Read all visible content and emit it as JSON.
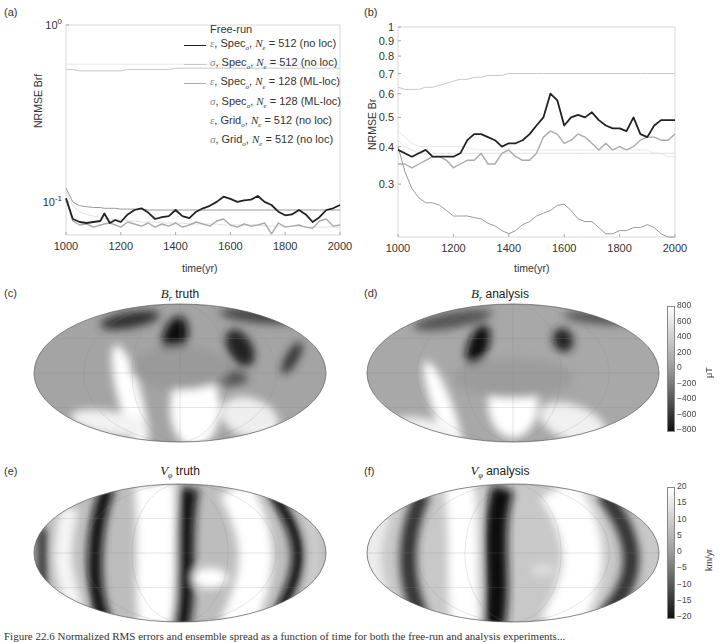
{
  "panels": {
    "a": {
      "label": "(a)"
    },
    "b": {
      "label": "(b)"
    },
    "c": {
      "label": "(c)",
      "title_var": "B",
      "title_sub": "r",
      "title_rest": " truth"
    },
    "d": {
      "label": "(d)",
      "title_var": "B",
      "title_sub": "r",
      "title_rest": " analysis"
    },
    "e": {
      "label": "(e)",
      "title_var": "V",
      "title_sub": "φ",
      "title_rest": " truth"
    },
    "f": {
      "label": "(f)",
      "title_var": "V",
      "title_sub": "φ",
      "title_rest": " analysis"
    }
  },
  "legend": {
    "title": "Free-run",
    "entries": [
      {
        "sym": "ε",
        "grid": "Spec",
        "n": "512",
        "loc": "(no loc)",
        "color": "#222222",
        "width": 1.8
      },
      {
        "sym": "σ",
        "grid": "Spec",
        "n": "512",
        "loc": "(no loc)",
        "color": "#c8c8c8",
        "width": 1
      },
      {
        "sym": "ε",
        "grid": "Spec",
        "n": "128",
        "loc": "(ML-loc)",
        "color": "#aaaaaa",
        "width": 1.4
      },
      {
        "sym": "σ",
        "grid": "Spec",
        "n": "128",
        "loc": "(ML-loc)",
        "color": "#e0e0e0",
        "width": 1
      },
      {
        "sym": "ε",
        "grid": "Grid",
        "n": "512",
        "loc": "(no loc)",
        "color": "#9a9a9a",
        "width": 1
      },
      {
        "sym": "σ",
        "grid": "Grid",
        "n": "512",
        "loc": "(no loc)",
        "color": "#e8e8e8",
        "width": 1
      }
    ]
  },
  "colorbars": {
    "br": {
      "ticks": [
        "800",
        "600",
        "400",
        "200",
        "0",
        "−200",
        "−400",
        "−600",
        "−800"
      ],
      "unit": "μT"
    },
    "vphi": {
      "ticks": [
        "20",
        "15",
        "10",
        "5",
        "0",
        "−5",
        "−10",
        "−15",
        "−20"
      ],
      "unit": "km/yr"
    }
  },
  "caption": "Figure 22.6  Normalized RMS errors and ensemble spread as a function of time for both the free-run and analysis experiments...",
  "chart_data": [
    {
      "type": "line",
      "panel": "a",
      "title": "",
      "xlabel": "time(yr)",
      "ylabel": "NRMSE Brf",
      "yscale": "log",
      "xlim": [
        1000,
        2000
      ],
      "ylim": [
        0.065,
        1.0
      ],
      "xticks": [
        "1000",
        "1200",
        "1400",
        "1600",
        "1800",
        "2000"
      ],
      "yticks": [
        {
          "v": 1.0,
          "label": "10^0"
        },
        {
          "v": 0.1,
          "label": "10^-1"
        }
      ],
      "legend_position": "upper right",
      "x": [
        1000,
        1025,
        1050,
        1075,
        1100,
        1125,
        1140,
        1160,
        1180,
        1200,
        1225,
        1250,
        1275,
        1300,
        1325,
        1350,
        1375,
        1400,
        1425,
        1450,
        1475,
        1500,
        1525,
        1550,
        1575,
        1600,
        1625,
        1650,
        1675,
        1700,
        1725,
        1750,
        1775,
        1800,
        1825,
        1850,
        1875,
        1900,
        1925,
        1950,
        1975,
        2000
      ],
      "series": [
        {
          "name": "ε, Spec_o, N_e = 512 (no loc)",
          "values": [
            0.105,
            0.08,
            0.077,
            0.076,
            0.077,
            0.078,
            0.086,
            0.076,
            0.079,
            0.077,
            0.085,
            0.09,
            0.092,
            0.087,
            0.08,
            0.082,
            0.083,
            0.09,
            0.083,
            0.081,
            0.088,
            0.092,
            0.095,
            0.1,
            0.107,
            0.104,
            0.1,
            0.102,
            0.103,
            0.108,
            0.1,
            0.096,
            0.088,
            0.084,
            0.085,
            0.09,
            0.085,
            0.077,
            0.082,
            0.09,
            0.092,
            0.096
          ]
        },
        {
          "name": "σ, Spec_o, N_e = 512 (no loc)",
          "values": [
            0.56,
            0.56,
            0.55,
            0.55,
            0.55,
            0.55,
            0.55,
            0.55,
            0.55,
            0.55,
            0.56,
            0.56,
            0.56,
            0.56,
            0.56,
            0.56,
            0.56,
            0.57,
            0.57,
            0.57,
            0.57,
            0.57,
            0.57,
            0.57,
            0.57,
            0.57,
            0.57,
            0.57,
            0.57,
            0.57,
            0.57,
            0.57,
            0.57,
            0.57,
            0.57,
            0.57,
            0.57,
            0.57,
            0.57,
            0.57,
            0.57,
            0.57
          ]
        },
        {
          "name": "ε, Spec_o, N_e = 128 (ML-loc)",
          "values": [
            0.105,
            0.078,
            0.074,
            0.075,
            0.072,
            0.074,
            0.075,
            0.076,
            0.074,
            0.072,
            0.077,
            0.075,
            0.073,
            0.076,
            0.072,
            0.075,
            0.073,
            0.076,
            0.072,
            0.074,
            0.077,
            0.075,
            0.073,
            0.078,
            0.08,
            0.074,
            0.072,
            0.075,
            0.073,
            0.074,
            0.076,
            0.066,
            0.076,
            0.072,
            0.073,
            0.074,
            0.072,
            0.071,
            0.078,
            0.08,
            0.073,
            0.074
          ]
        },
        {
          "name": "σ, Spec_o, N_e = 128 (ML-loc)",
          "values": [
            0.115,
            0.095,
            0.088,
            0.085,
            0.083,
            0.082,
            0.081,
            0.08,
            0.079,
            0.079,
            0.078,
            0.078,
            0.077,
            0.077,
            0.077,
            0.076,
            0.076,
            0.076,
            0.076,
            0.075,
            0.075,
            0.075,
            0.075,
            0.075,
            0.074,
            0.074,
            0.074,
            0.074,
            0.074,
            0.074,
            0.073,
            0.073,
            0.073,
            0.073,
            0.073,
            0.073,
            0.072,
            0.072,
            0.072,
            0.072,
            0.072,
            0.072
          ]
        },
        {
          "name": "ε, Grid_o, N_e = 512 (no loc)",
          "values": [
            0.12,
            0.1,
            0.095,
            0.094,
            0.093,
            0.093,
            0.092,
            0.092,
            0.092,
            0.091,
            0.091,
            0.091,
            0.091,
            0.09,
            0.09,
            0.09,
            0.09,
            0.09,
            0.09,
            0.09,
            0.09,
            0.09,
            0.09,
            0.09,
            0.09,
            0.09,
            0.09,
            0.09,
            0.09,
            0.09,
            0.09,
            0.09,
            0.09,
            0.09,
            0.09,
            0.09,
            0.09,
            0.09,
            0.09,
            0.09,
            0.09,
            0.09
          ]
        },
        {
          "name": "σ, Grid_o, N_e = 512 (no loc)",
          "values": [
            0.6,
            0.6,
            0.6,
            0.6,
            0.6,
            0.6,
            0.6,
            0.6,
            0.6,
            0.6,
            0.6,
            0.6,
            0.6,
            0.6,
            0.6,
            0.6,
            0.6,
            0.6,
            0.6,
            0.6,
            0.6,
            0.6,
            0.6,
            0.6,
            0.6,
            0.6,
            0.6,
            0.6,
            0.6,
            0.6,
            0.6,
            0.6,
            0.6,
            0.6,
            0.6,
            0.6,
            0.6,
            0.6,
            0.6,
            0.6,
            0.6,
            0.6
          ]
        }
      ]
    },
    {
      "type": "line",
      "panel": "b",
      "title": "",
      "xlabel": "time(yr)",
      "ylabel": "NRMSE Br",
      "yscale": "log",
      "xlim": [
        1000,
        2000
      ],
      "ylim": [
        0.2,
        1.0
      ],
      "xticks": [
        "1000",
        "1200",
        "1400",
        "1600",
        "1800",
        "2000"
      ],
      "yticks": [
        {
          "v": 1.0,
          "label": "1"
        },
        {
          "v": 0.9,
          "label": "0.9"
        },
        {
          "v": 0.8,
          "label": "0.8"
        },
        {
          "v": 0.7,
          "label": "0.7"
        },
        {
          "v": 0.6,
          "label": "0.6"
        },
        {
          "v": 0.5,
          "label": "0.5"
        },
        {
          "v": 0.4,
          "label": "0.4"
        },
        {
          "v": 0.3,
          "label": "0.3"
        }
      ],
      "x": [
        1000,
        1025,
        1050,
        1075,
        1100,
        1125,
        1150,
        1175,
        1200,
        1225,
        1250,
        1275,
        1300,
        1325,
        1350,
        1375,
        1400,
        1425,
        1450,
        1475,
        1500,
        1525,
        1550,
        1575,
        1600,
        1625,
        1650,
        1675,
        1700,
        1725,
        1750,
        1775,
        1800,
        1825,
        1850,
        1875,
        1900,
        1925,
        1950,
        1975,
        2000
      ],
      "series": [
        {
          "name": "ε, Spec_o, N_e = 512 (no loc)",
          "values": [
            0.39,
            0.38,
            0.37,
            0.38,
            0.39,
            0.37,
            0.37,
            0.37,
            0.37,
            0.38,
            0.42,
            0.44,
            0.44,
            0.43,
            0.42,
            0.4,
            0.41,
            0.41,
            0.42,
            0.44,
            0.47,
            0.5,
            0.6,
            0.57,
            0.47,
            0.5,
            0.51,
            0.5,
            0.52,
            0.49,
            0.47,
            0.46,
            0.46,
            0.45,
            0.5,
            0.44,
            0.43,
            0.47,
            0.49,
            0.49,
            0.49
          ]
        },
        {
          "name": "σ, Spec_o, N_e = 512 (no loc)",
          "values": [
            0.63,
            0.62,
            0.62,
            0.62,
            0.63,
            0.63,
            0.64,
            0.65,
            0.66,
            0.67,
            0.67,
            0.68,
            0.68,
            0.69,
            0.69,
            0.69,
            0.7,
            0.7,
            0.7,
            0.7,
            0.7,
            0.7,
            0.7,
            0.7,
            0.7,
            0.7,
            0.7,
            0.7,
            0.7,
            0.7,
            0.7,
            0.7,
            0.7,
            0.7,
            0.7,
            0.7,
            0.7,
            0.7,
            0.7,
            0.7,
            0.7
          ]
        },
        {
          "name": "ε, Spec_o, N_e = 128 (ML-loc)",
          "values": [
            0.35,
            0.35,
            0.34,
            0.35,
            0.36,
            0.37,
            0.37,
            0.36,
            0.34,
            0.35,
            0.36,
            0.36,
            0.38,
            0.35,
            0.35,
            0.38,
            0.39,
            0.37,
            0.36,
            0.36,
            0.38,
            0.43,
            0.45,
            0.44,
            0.41,
            0.42,
            0.44,
            0.43,
            0.41,
            0.39,
            0.41,
            0.39,
            0.4,
            0.39,
            0.4,
            0.42,
            0.43,
            0.43,
            0.42,
            0.42,
            0.44
          ]
        },
        {
          "name": "σ, Spec_o, N_e = 128 (ML-loc)",
          "values": [
            0.42,
            0.4,
            0.39,
            0.38,
            0.38,
            0.38,
            0.38,
            0.38,
            0.38,
            0.38,
            0.38,
            0.38,
            0.38,
            0.38,
            0.38,
            0.38,
            0.38,
            0.38,
            0.38,
            0.38,
            0.38,
            0.38,
            0.38,
            0.38,
            0.38,
            0.38,
            0.38,
            0.38,
            0.38,
            0.38,
            0.38,
            0.38,
            0.38,
            0.38,
            0.38,
            0.38,
            0.38,
            0.38,
            0.38,
            0.38,
            0.38
          ]
        },
        {
          "name": "ε, Grid_o, N_e = 512 (no loc)",
          "values": [
            0.4,
            0.33,
            0.29,
            0.27,
            0.26,
            0.26,
            0.255,
            0.245,
            0.235,
            0.235,
            0.235,
            0.232,
            0.23,
            0.222,
            0.218,
            0.21,
            0.205,
            0.21,
            0.22,
            0.225,
            0.235,
            0.24,
            0.245,
            0.255,
            0.257,
            0.245,
            0.23,
            0.225,
            0.225,
            0.215,
            0.205,
            0.205,
            0.21,
            0.21,
            0.215,
            0.215,
            0.22,
            0.215,
            0.205,
            0.2,
            0.193
          ]
        },
        {
          "name": "σ, Grid_o, N_e = 512 (no loc)",
          "values": [
            0.45,
            0.43,
            0.41,
            0.4,
            0.4,
            0.4,
            0.4,
            0.4,
            0.4,
            0.4,
            0.4,
            0.39,
            0.39,
            0.39,
            0.39,
            0.39,
            0.39,
            0.39,
            0.39,
            0.39,
            0.39,
            0.39,
            0.39,
            0.39,
            0.39,
            0.39,
            0.39,
            0.39,
            0.39,
            0.39,
            0.39,
            0.39,
            0.39,
            0.39,
            0.39,
            0.39,
            0.39,
            0.38,
            0.38,
            0.37,
            0.37
          ]
        }
      ]
    }
  ]
}
